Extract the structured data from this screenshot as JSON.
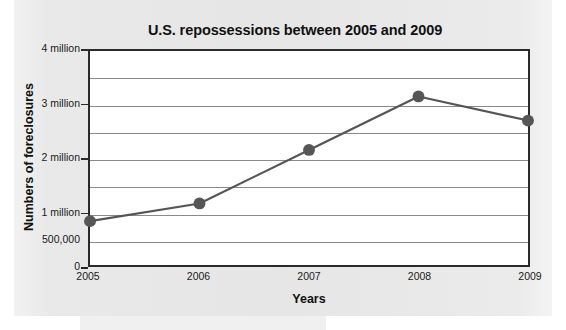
{
  "chart_data": {
    "type": "line",
    "title": "U.S. repossessions between 2005 and 2009",
    "xlabel": "Years",
    "ylabel": "Numbers of foreclosures",
    "categories": [
      "2005",
      "2006",
      "2007",
      "2008",
      "2009"
    ],
    "x": [
      2005,
      2006,
      2007,
      2008,
      2009
    ],
    "values": [
      820000,
      1150000,
      2150000,
      3150000,
      2700000
    ],
    "series": [
      {
        "name": "Numbers of foreclosures",
        "values": [
          820000,
          1150000,
          2150000,
          3150000,
          2700000
        ]
      }
    ],
    "ylim": [
      0,
      4000000
    ],
    "xlim": [
      2005,
      2009
    ],
    "grid": "horizontal",
    "gridline_interval": 500000,
    "legend": "none",
    "marker": "filled-circle",
    "line_color": "#555555",
    "marker_color": "#565656",
    "gridline_color": "#8a8a8a",
    "axis_color": "#2a2a2a",
    "plot_background": "#ffffff",
    "page_background": "#e8e8e8",
    "y_ticks": [
      {
        "value": 0,
        "label": "0"
      },
      {
        "value": 500000,
        "label": "500,000"
      },
      {
        "value": 1000000,
        "label": "1 million"
      },
      {
        "value": 2000000,
        "label": "2 million"
      },
      {
        "value": 3000000,
        "label": "3 million"
      },
      {
        "value": 4000000,
        "label": "4 million"
      }
    ],
    "x_ticks": [
      {
        "value": 2005,
        "label": "2005"
      },
      {
        "value": 2006,
        "label": "2006"
      },
      {
        "value": 2007,
        "label": "2007"
      },
      {
        "value": 2008,
        "label": "2008"
      },
      {
        "value": 2009,
        "label": "2009"
      }
    ]
  }
}
